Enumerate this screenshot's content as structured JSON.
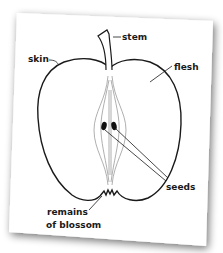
{
  "diagram": {
    "colors": {
      "card": "#ffffff",
      "shadow": "#9a9a9a",
      "outline": "#1a1a1a",
      "core_lines": "#8a8a8a",
      "seed": "#111111"
    },
    "labels": {
      "stem": "stem",
      "skin": "skin",
      "flesh": "flesh",
      "seeds": "seeds",
      "blossom_line1": "remains",
      "blossom_line2": "of blossom"
    }
  }
}
